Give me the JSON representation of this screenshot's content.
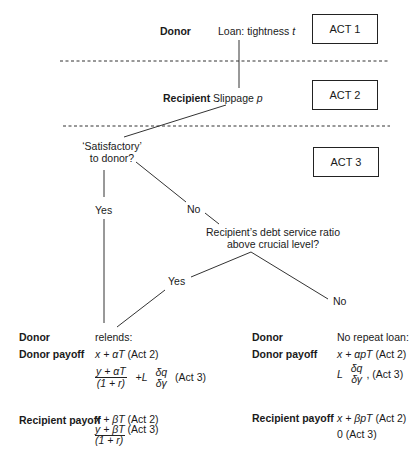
{
  "acts": [
    {
      "label": "ACT 1"
    },
    {
      "label": "ACT 2"
    },
    {
      "label": "ACT 3"
    }
  ],
  "act1": {
    "actor": "Donor",
    "action": "Loan: tightness ",
    "action_var": "t"
  },
  "act2": {
    "actor": "Recipient",
    "action": "Slippage ",
    "action_var": "p"
  },
  "act3": {
    "question1_line1": "‘Satisfactory’",
    "question1_line2": "to donor?",
    "yes1": "Yes",
    "no1": "No",
    "question2_line1": "Recipient’s debt service ratio",
    "question2_line2": "above crucial level?",
    "yes2": "Yes",
    "no2": "No"
  },
  "left_outcome": {
    "donor_label": "Donor",
    "donor_action": "relends:",
    "donor_payoff_label": "Donor payoff",
    "donor_payoff_act2": "x + αT",
    "donor_payoff_act2_tag": " (Act 2)",
    "donor_payoff_act3_num": "y + αT",
    "donor_payoff_act3_den": "(1 + r)",
    "donor_payoff_act3_plus": "+L",
    "donor_payoff_act3_dnum": "δq",
    "donor_payoff_act3_dden": "δγ",
    "donor_payoff_act3_tag": "(Act 3)",
    "recipient_payoff_label": "Recipient payoff",
    "recipient_payoff_act2": "x + βT",
    "recipient_payoff_act2_tag": " (Act 2)",
    "recipient_payoff_act3_num": "y + βT",
    "recipient_payoff_act3_tag": " (Act 3)",
    "recipient_payoff_act3_den": "(1 + r)"
  },
  "right_outcome": {
    "donor_label": "Donor",
    "donor_action": "No repeat loan:",
    "donor_payoff_label": "Donor payoff",
    "donor_payoff_act2": "x + αpT",
    "donor_payoff_act2_tag": " (Act 2)",
    "donor_payoff_act3_L": "L",
    "donor_payoff_act3_dnum": "δq",
    "donor_payoff_act3_dden": "δγ",
    "donor_payoff_act3_tag": ", (Act 3)",
    "recipient_payoff_label": "Recipient payoff",
    "recipient_payoff_act2": "x + βpT",
    "recipient_payoff_act2_tag": " (Act 2)",
    "recipient_payoff_act3": "0 (Act 3)"
  }
}
